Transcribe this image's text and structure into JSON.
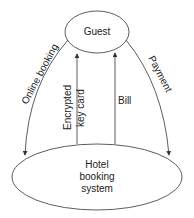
{
  "nodes": {
    "guest": {
      "label": "Guest"
    },
    "hotel": {
      "line1": "Hotel",
      "line2": "booking",
      "line3": "system"
    }
  },
  "flows": {
    "online_booking": "Online booking",
    "payment": "Payment",
    "encrypted_key_card_line1": "Encrypted",
    "encrypted_key_card_line2": "key card",
    "bill": "Bill"
  },
  "colors": {
    "stroke": "#333333",
    "text": "#222222",
    "background": "#ffffff"
  }
}
